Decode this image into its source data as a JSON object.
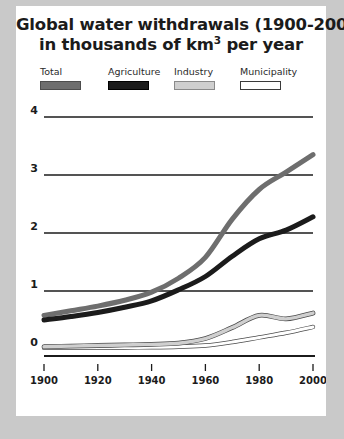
{
  "title": {
    "line1": "Global water withdrawals (1900-2000)",
    "line2_pre": "in thousands of km",
    "line2_sup": "3",
    "line2_post": " per year"
  },
  "legend": {
    "items": [
      {
        "label": "Total",
        "color": "#6e6e6e",
        "border": "#4d4d4d",
        "name": "legend-item-total"
      },
      {
        "label": "Agriculture",
        "color": "#1b1b1b",
        "border": "#000000",
        "name": "legend-item-agriculture"
      },
      {
        "label": "Industry",
        "color": "#cfcfcf",
        "border": "#8a8a8a",
        "name": "legend-item-industry"
      },
      {
        "label": "Municipality",
        "color": "#ffffff",
        "border": "#3a3a3a",
        "name": "legend-item-municipality"
      }
    ]
  },
  "axes": {
    "y_ticks": [
      "4",
      "3",
      "2",
      "1",
      "0"
    ],
    "x_ticks": [
      "1900",
      "1920",
      "1940",
      "1960",
      "1980",
      "2000"
    ]
  },
  "chart_data": {
    "type": "line",
    "title": "Global water withdrawals (1900-2000) in thousands of km3 per year",
    "xlabel": "",
    "ylabel": "thousands of km3 per year",
    "xlim": [
      1900,
      2000
    ],
    "ylim": [
      0,
      4
    ],
    "x": [
      1900,
      1910,
      1920,
      1930,
      1940,
      1950,
      1960,
      1970,
      1980,
      1990,
      2000
    ],
    "grid": "horizontal",
    "legend_position": "top",
    "series": [
      {
        "name": "Total",
        "color": "#6e6e6e",
        "values": [
          0.58,
          0.66,
          0.74,
          0.84,
          0.98,
          1.22,
          1.58,
          2.24,
          2.75,
          3.05,
          3.35
        ]
      },
      {
        "name": "Agriculture",
        "color": "#1b1b1b",
        "values": [
          0.5,
          0.56,
          0.63,
          0.72,
          0.83,
          1.02,
          1.25,
          1.6,
          1.9,
          2.05,
          2.28
        ]
      },
      {
        "name": "Industry",
        "color": "#cfcfcf",
        "values": [
          0.04,
          0.05,
          0.06,
          0.07,
          0.08,
          0.1,
          0.18,
          0.37,
          0.58,
          0.52,
          0.62
        ]
      },
      {
        "name": "Municipality",
        "color": "#ffffff",
        "values": [
          0.02,
          0.02,
          0.02,
          0.025,
          0.03,
          0.04,
          0.06,
          0.12,
          0.2,
          0.28,
          0.38
        ]
      }
    ]
  }
}
